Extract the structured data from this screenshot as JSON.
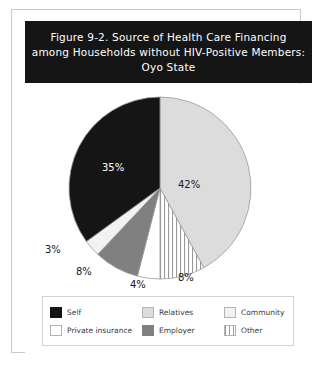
{
  "figure": {
    "title_lines": [
      "Figure 9-2. Source of Health Care Financing",
      "among Households without HIV-Positive Members:",
      "Oyo State"
    ],
    "title_background": "#151515",
    "title_color": "#ffffff"
  },
  "chart_data": {
    "type": "pie",
    "title": "Figure 9-2. Source of Health Care Financing among Households without HIV-Positive Members: Oyo State",
    "xlabel": "",
    "ylabel": "",
    "units": "percent",
    "start_angle_deg": 0,
    "direction": "clockwise",
    "legend_position": "bottom",
    "grid": false,
    "categories": [
      "Relatives",
      "Other",
      "Private insurance",
      "Employer",
      "Community",
      "Self"
    ],
    "values": [
      42,
      8,
      4,
      8,
      3,
      35
    ],
    "labels": [
      "42%",
      "8%",
      "4%",
      "8%",
      "3%",
      "35%"
    ],
    "colors": [
      "#dcdcdc",
      "#ffffff",
      "#ffffff",
      "#808080",
      "#f2f2f2",
      "#151515"
    ],
    "patterns": [
      "solid",
      "vertical-stripes",
      "solid",
      "solid",
      "solid",
      "solid"
    ],
    "slices": [
      {
        "label": "Relatives",
        "value": 42,
        "display": "42%",
        "fill": "#dcdcdc",
        "pattern": "solid",
        "label_color": "#1a1a1a"
      },
      {
        "label": "Other",
        "value": 8,
        "display": "8%",
        "fill": "#ffffff",
        "pattern": "vertical-stripes",
        "label_color": "#1a1a1a"
      },
      {
        "label": "Private insurance",
        "value": 4,
        "display": "4%",
        "fill": "#ffffff",
        "pattern": "solid",
        "label_color": "#1a1a1a"
      },
      {
        "label": "Employer",
        "value": 8,
        "display": "8%",
        "fill": "#808080",
        "pattern": "solid",
        "label_color": "#1a1a1a"
      },
      {
        "label": "Community",
        "value": 3,
        "display": "3%",
        "fill": "#f2f2f2",
        "pattern": "solid",
        "label_color": "#1a1a1a"
      },
      {
        "label": "Self",
        "value": 35,
        "display": "35%",
        "fill": "#151515",
        "pattern": "solid",
        "label_color": "#ffffff"
      }
    ]
  },
  "legend": {
    "items": [
      {
        "label": "Self",
        "swatch": "self"
      },
      {
        "label": "Relatives",
        "swatch": "relatives"
      },
      {
        "label": "Community",
        "swatch": "community"
      },
      {
        "label": "Private insurance",
        "swatch": "private"
      },
      {
        "label": "Employer",
        "swatch": "employer"
      },
      {
        "label": "Other",
        "swatch": "other"
      }
    ]
  },
  "pct_labels": {
    "relatives": "42%",
    "other": "8%",
    "private": "4%",
    "employer": "8%",
    "community": "3%",
    "self": "35%"
  }
}
